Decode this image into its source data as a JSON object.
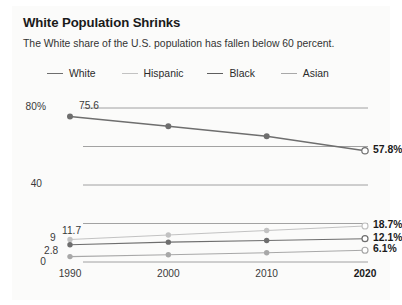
{
  "header": {
    "title": "White Population Shrinks",
    "subtitle": "The White share of the U.S. population has fallen below 60 percent."
  },
  "chart_data": {
    "type": "line",
    "title": "White Population Shrinks",
    "subtitle": "The White share of the U.S. population has fallen below 60 percent.",
    "xlabel": "",
    "ylabel": "",
    "x": [
      "1990",
      "2000",
      "2010",
      "2020"
    ],
    "xticklabels": [
      "1990",
      "2000",
      "2010",
      "2020"
    ],
    "yticklabels": [
      "80%",
      "",
      "40",
      "",
      "0"
    ],
    "ytickvalues": [
      80,
      60,
      40,
      20,
      0
    ],
    "ylim": [
      0,
      80
    ],
    "grid": true,
    "legend_position": "top",
    "series": [
      {
        "name": "White",
        "color": "#6e6e6e",
        "values": [
          75.6,
          70.5,
          65.3,
          57.8
        ],
        "start_label": "75.6",
        "end_label": "57.8%"
      },
      {
        "name": "Hispanic",
        "color": "#c2c2c2",
        "values": [
          11.7,
          14.0,
          16.4,
          18.7
        ],
        "start_label": "11.7",
        "end_label": "18.7%"
      },
      {
        "name": "Black",
        "color": "#6e6e6e",
        "values": [
          9.0,
          10.3,
          11.2,
          12.1
        ],
        "start_label": "9",
        "end_label": "12.1%"
      },
      {
        "name": "Asian",
        "color": "#a8a8a8",
        "values": [
          2.8,
          3.8,
          4.8,
          6.1
        ],
        "start_label": "2.8",
        "end_label": "6.1%"
      }
    ],
    "zero_label": "0",
    "legend": [
      "White",
      "Hispanic",
      "Black",
      "Asian"
    ]
  },
  "colors": {
    "panel_background": "#fbfbfa",
    "gridline": "#8c8c8c",
    "text": "#231f20"
  }
}
